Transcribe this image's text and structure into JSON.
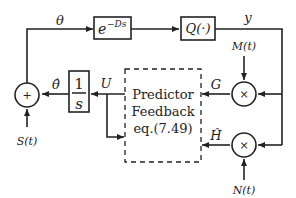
{
  "diagram": {
    "type": "block-diagram",
    "blocks": {
      "delay": {
        "label": "e",
        "superscript": "−Ds"
      },
      "quantizer": {
        "label": "Q(·)"
      },
      "integrator": {
        "numerator": "1",
        "denominator": "s"
      },
      "predictor": {
        "lines": [
          "Predictor",
          "Feedback",
          "eq.(7.49)"
        ]
      }
    },
    "junctions": {
      "summer": {
        "symbol": "+"
      },
      "mult_top": {
        "symbol": "×"
      },
      "mult_bottom": {
        "symbol": "×"
      }
    },
    "signals": {
      "theta": "θ",
      "theta_hat": "θ̂",
      "y": "y",
      "U": "U",
      "G": "G",
      "H_hat": "Ĥ",
      "M": "M(t)",
      "N": "N(t)",
      "S": "S(t)"
    }
  }
}
